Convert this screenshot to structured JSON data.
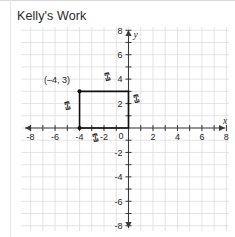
{
  "page": {
    "title": "Kelly's Work",
    "background_color": "#ffffff",
    "rule_color": "#d8d8d8"
  },
  "chart_data": {
    "type": "scatter",
    "title": "Kelly's Work",
    "subtitle": "",
    "xlabel": "x",
    "ylabel": "y",
    "xlim": [
      -8.6,
      8.6
    ],
    "ylim": [
      -8.6,
      8.6
    ],
    "grid": true,
    "grid_spacing": 1,
    "legend": "none",
    "x_ticks": [
      -8,
      -6,
      -4,
      -2,
      0,
      2,
      4,
      6,
      8
    ],
    "y_ticks": [
      8,
      6,
      4,
      2,
      0,
      -2,
      -4,
      -6,
      -8
    ],
    "x_tick_labels": [
      "-8",
      "-6",
      "-4",
      "-2",
      "0",
      "2",
      "4",
      "6",
      "8"
    ],
    "y_tick_labels": [
      "8",
      "6",
      "4",
      "2",
      "0",
      "-2",
      "-4",
      "-6",
      "-8"
    ],
    "axis_arrows": [
      "left",
      "right",
      "up",
      "down"
    ],
    "shapes": [
      {
        "name": "rectangle",
        "kind": "polygon",
        "closed": true,
        "stroke_color": "#111111",
        "vertices": [
          [
            -4,
            3
          ],
          [
            0,
            3
          ],
          [
            0,
            0
          ],
          [
            -4,
            0
          ]
        ],
        "width_units": 4,
        "height_units": 3
      }
    ],
    "annotations": [
      {
        "name": "vertex-label",
        "text": "(–4, 3)",
        "x": -6.9,
        "y": 3.7
      },
      {
        "name": "tick-mark-top",
        "text": "⑄",
        "x": -1.6,
        "y": 3.9
      },
      {
        "name": "tick-mark-right",
        "text": "⑄",
        "x": 0.7,
        "y": 2.1
      },
      {
        "name": "tick-mark-left",
        "text": "⑄",
        "x": -4.9,
        "y": 1.5
      },
      {
        "name": "tick-mark-bottom",
        "text": "⑄",
        "x": -2.6,
        "y": -1.1
      }
    ],
    "marked_points": [
      {
        "label": "(–4, 3)",
        "x": -4,
        "y": 3
      }
    ]
  },
  "graph": {
    "title_label": "Kelly's Work",
    "x_axis_label": "x",
    "y_axis_label": "y",
    "vertex_label": "(–4, 3)",
    "hand_mark_glyph": "⑄"
  }
}
